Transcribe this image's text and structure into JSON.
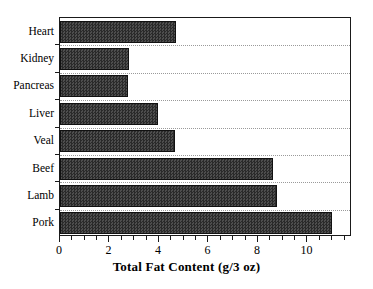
{
  "chart_data": {
    "type": "bar",
    "orientation": "horizontal",
    "title": "",
    "xlabel": "Total Fat Content (g/3 oz)",
    "ylabel": "",
    "categories": [
      "Heart",
      "Kidney",
      "Pancreas",
      "Liver",
      "Veal",
      "Beef",
      "Lamb",
      "Pork"
    ],
    "values": [
      4.7,
      2.8,
      2.75,
      3.95,
      4.65,
      8.6,
      8.75,
      11.0
    ],
    "xlim": [
      0,
      11.8
    ],
    "xticks": [
      0,
      2,
      4,
      6,
      8,
      10
    ],
    "xticklabels": [
      "0",
      "2",
      "4",
      "6",
      "8",
      "10"
    ],
    "minor_tick_interval": 0.5,
    "grid": true,
    "grid_axis": "y",
    "grid_style": "dotted",
    "legend": null,
    "bar_fill_color": "#3b3b3b",
    "bar_edge_color": "#111111",
    "frame_color": "#1a1a1a",
    "background_color": "#ffffff"
  },
  "axis": {
    "x_title": "Total Fat Content (g/3 oz)"
  }
}
